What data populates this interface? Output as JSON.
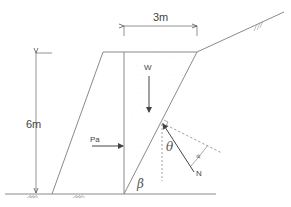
{
  "diagram": {
    "colors": {
      "line": "#8a8a8a",
      "arrow": "#555555",
      "text": "#444444",
      "background": "#ffffff"
    },
    "labels": {
      "width_dimension": "3m",
      "height_dimension": "6m",
      "weight": "W",
      "active_force": "Pa",
      "normal_force": "N",
      "theta": "θ",
      "beta": "β",
      "phi_angle": "φ"
    },
    "elements": [
      {
        "id": "ground-line",
        "type": "line",
        "label": ""
      },
      {
        "id": "retaining-wall",
        "type": "trapezoid",
        "label": ""
      },
      {
        "id": "soil-wedge",
        "type": "triangle",
        "label": "W"
      },
      {
        "id": "failure-plane",
        "type": "line",
        "label": "β"
      },
      {
        "id": "backfill-slope",
        "type": "line",
        "label": ""
      },
      {
        "id": "reaction-force",
        "type": "arrow",
        "label": "N"
      }
    ]
  }
}
